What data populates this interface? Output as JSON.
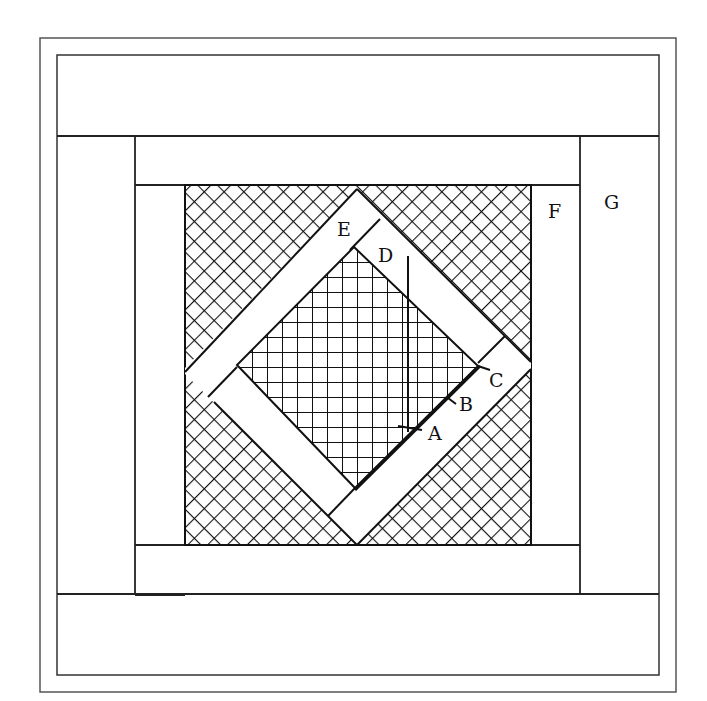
{
  "figure": {
    "colors": {
      "line": "#1a1a1a",
      "frame": "#555555",
      "background": "#ffffff"
    },
    "labels": {
      "A": "A",
      "B": "B",
      "C": "C",
      "D": "D",
      "E": "E",
      "F": "F",
      "G": "G"
    },
    "regions": [
      {
        "id": "outer-frame",
        "fill": "none"
      },
      {
        "id": "top-strip-G-row",
        "fill": "plain"
      },
      {
        "id": "left-strip",
        "fill": "plain"
      },
      {
        "id": "right-strip-G",
        "fill": "plain"
      },
      {
        "id": "bottom-strip",
        "fill": "plain"
      },
      {
        "id": "inner-top-strip",
        "fill": "plain"
      },
      {
        "id": "inner-left-strip",
        "fill": "plain"
      },
      {
        "id": "inner-right-strip-F",
        "fill": "plain"
      },
      {
        "id": "inner-bottom-strip",
        "fill": "plain"
      },
      {
        "id": "corner-triangles",
        "fill": "diagonal-crosshatch"
      },
      {
        "id": "diamond-frame",
        "fill": "plain"
      },
      {
        "id": "center-diamond",
        "fill": "square-grid"
      }
    ]
  }
}
